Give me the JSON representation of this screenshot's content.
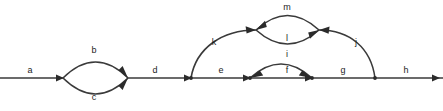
{
  "diagram": {
    "type": "feynman-style-graph",
    "title": "",
    "canvas": {
      "width": 443,
      "height": 111
    },
    "colors": {
      "background": "#ffffff",
      "line": "#3a3a3a",
      "arrow": "#2b2b2b",
      "label": "#1c1c1c"
    },
    "baseline_y": 78,
    "nodes": [
      {
        "id": "n0",
        "x": 0,
        "y": 78
      },
      {
        "id": "n1",
        "x": 63,
        "y": 78
      },
      {
        "id": "n2",
        "x": 128,
        "y": 78
      },
      {
        "id": "n3",
        "x": 191,
        "y": 78
      },
      {
        "id": "n4",
        "x": 250,
        "y": 78
      },
      {
        "id": "n5",
        "x": 312,
        "y": 78
      },
      {
        "id": "n6",
        "x": 375,
        "y": 78
      },
      {
        "id": "n7",
        "x": 443,
        "y": 78
      },
      {
        "id": "n8",
        "x": 256,
        "y": 30
      },
      {
        "id": "n9",
        "x": 319,
        "y": 30
      }
    ],
    "edges": [
      {
        "id": "a",
        "label": "a",
        "from": "n0",
        "to": "n1",
        "shape": "straight",
        "label_x": 30,
        "label_y": 70
      },
      {
        "id": "b",
        "label": "b",
        "from": "n1",
        "to": "n2",
        "shape": "arc-up",
        "label_x": 94,
        "label_y": 50
      },
      {
        "id": "c",
        "label": "c",
        "from": "n1",
        "to": "n2",
        "shape": "arc-down",
        "label_x": 94,
        "label_y": 97
      },
      {
        "id": "d",
        "label": "d",
        "from": "n2",
        "to": "n3",
        "shape": "straight",
        "label_x": 155,
        "label_y": 70
      },
      {
        "id": "e",
        "label": "e",
        "from": "n3",
        "to": "n4",
        "shape": "straight",
        "label_x": 221,
        "label_y": 70
      },
      {
        "id": "k",
        "label": "k",
        "from": "n3",
        "to": "n8",
        "shape": "arc-up",
        "label_x": 214,
        "label_y": 42
      },
      {
        "id": "m",
        "label": "m",
        "from": "n8",
        "to": "n9",
        "shape": "arc-up",
        "label_x": 287,
        "label_y": 7
      },
      {
        "id": "l",
        "label": "l",
        "from": "n8",
        "to": "n9",
        "shape": "arc-down",
        "label_x": 287,
        "label_y": 38
      },
      {
        "id": "i",
        "label": "i",
        "from": "n4",
        "to": "n5",
        "shape": "arc-up",
        "label_x": 287,
        "label_y": 54
      },
      {
        "id": "f",
        "label": "f",
        "from": "n4",
        "to": "n5",
        "shape": "straight",
        "label_x": 287,
        "label_y": 70
      },
      {
        "id": "g",
        "label": "g",
        "from": "n5",
        "to": "n6",
        "shape": "straight",
        "label_x": 343,
        "label_y": 70
      },
      {
        "id": "j",
        "label": "j",
        "from": "n6",
        "to": "n9",
        "shape": "arc-up",
        "label_x": 356,
        "label_y": 42
      },
      {
        "id": "h",
        "label": "h",
        "from": "n6",
        "to": "n7",
        "shape": "straight",
        "label_x": 406,
        "label_y": 70
      }
    ]
  }
}
